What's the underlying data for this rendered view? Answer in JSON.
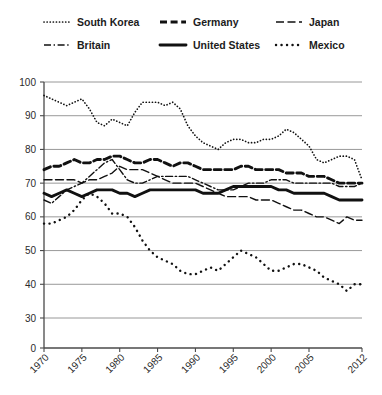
{
  "chart_data": {
    "type": "line",
    "title": "",
    "subtitle": "",
    "xlabel": "",
    "ylabel": "",
    "xlim": [
      1970,
      2012
    ],
    "ylim": [
      0,
      100
    ],
    "ytick_labels": [
      "0",
      "30",
      "40",
      "50",
      "60",
      "70",
      "80",
      "90",
      "100"
    ],
    "ytick_values": [
      0,
      30,
      40,
      50,
      60,
      70,
      80,
      90,
      100
    ],
    "y_axis_broken": true,
    "xtick_labels": [
      "1970",
      "1975",
      "1980",
      "1985",
      "1990",
      "1995",
      "2000",
      "2005",
      "2012"
    ],
    "xtick_values": [
      1970,
      1975,
      1980,
      1985,
      1990,
      1995,
      2000,
      2005,
      2012
    ],
    "grid": "horizontal",
    "legend_position": "top",
    "legend_columns": 3,
    "legend_rows": 2,
    "series": [
      {
        "name": "South Korea",
        "style": "dotted-fine",
        "marker": "dot",
        "x": [
          1970,
          1971,
          1972,
          1973,
          1974,
          1975,
          1976,
          1977,
          1978,
          1979,
          1980,
          1981,
          1982,
          1983,
          1984,
          1985,
          1986,
          1987,
          1988,
          1989,
          1990,
          1991,
          1992,
          1993,
          1994,
          1995,
          1996,
          1997,
          1998,
          1999,
          2000,
          2001,
          2002,
          2003,
          2004,
          2005,
          2006,
          2007,
          2008,
          2009,
          2010,
          2011,
          2012
        ],
        "values": [
          96,
          95,
          94,
          93,
          94,
          95,
          92,
          88,
          87,
          89,
          88,
          87,
          91,
          94,
          94,
          94,
          93,
          94,
          92,
          87,
          84,
          82,
          81,
          80,
          82,
          83,
          83,
          82,
          82,
          83,
          83,
          84,
          86,
          85,
          83,
          81,
          77,
          76,
          77,
          78,
          78,
          77,
          71
        ]
      },
      {
        "name": "Germany",
        "style": "dashed-bold",
        "x": [
          1970,
          1971,
          1972,
          1973,
          1974,
          1975,
          1976,
          1977,
          1978,
          1979,
          1980,
          1981,
          1982,
          1983,
          1984,
          1985,
          1986,
          1987,
          1988,
          1989,
          1990,
          1991,
          1992,
          1993,
          1994,
          1995,
          1996,
          1997,
          1998,
          1999,
          2000,
          2001,
          2002,
          2003,
          2004,
          2005,
          2006,
          2007,
          2008,
          2009,
          2010,
          2011,
          2012
        ],
        "values": [
          74,
          75,
          75,
          76,
          77,
          76,
          76,
          77,
          77,
          78,
          78,
          77,
          76,
          76,
          77,
          77,
          76,
          75,
          76,
          76,
          75,
          74,
          74,
          74,
          74,
          74,
          75,
          75,
          74,
          74,
          74,
          74,
          73,
          73,
          73,
          72,
          72,
          72,
          71,
          70,
          70,
          70,
          70
        ]
      },
      {
        "name": "Japan",
        "style": "dashed-thin",
        "x": [
          1970,
          1971,
          1972,
          1973,
          1974,
          1975,
          1976,
          1977,
          1978,
          1979,
          1980,
          1981,
          1982,
          1983,
          1984,
          1985,
          1986,
          1987,
          1988,
          1989,
          1990,
          1991,
          1992,
          1993,
          1994,
          1995,
          1996,
          1997,
          1998,
          1999,
          2000,
          2001,
          2002,
          2003,
          2004,
          2005,
          2006,
          2007,
          2008,
          2009,
          2010,
          2011,
          2012
        ],
        "values": [
          71,
          71,
          71,
          71,
          71,
          70,
          71,
          71,
          72,
          73,
          75,
          74,
          74,
          74,
          73,
          72,
          71,
          70,
          70,
          70,
          70,
          69,
          68,
          67,
          66,
          66,
          66,
          66,
          65,
          65,
          65,
          64,
          63,
          62,
          62,
          61,
          60,
          60,
          59,
          58,
          60,
          59,
          59
        ]
      },
      {
        "name": "Britain",
        "style": "dash-dot",
        "x": [
          1970,
          1971,
          1972,
          1973,
          1974,
          1975,
          1976,
          1977,
          1978,
          1979,
          1980,
          1981,
          1982,
          1983,
          1984,
          1985,
          1986,
          1987,
          1988,
          1989,
          1990,
          1991,
          1992,
          1993,
          1994,
          1995,
          1996,
          1997,
          1998,
          1999,
          2000,
          2001,
          2002,
          2003,
          2004,
          2005,
          2006,
          2007,
          2008,
          2009,
          2010,
          2011,
          2012
        ],
        "values": [
          65,
          64,
          66,
          68,
          69,
          70,
          72,
          74,
          76,
          77,
          74,
          71,
          70,
          70,
          71,
          72,
          72,
          72,
          72,
          72,
          71,
          70,
          69,
          68,
          68,
          68,
          69,
          70,
          70,
          70,
          71,
          71,
          71,
          70,
          70,
          70,
          70,
          70,
          70,
          69,
          69,
          69,
          70
        ]
      },
      {
        "name": "United States",
        "style": "solid-bold",
        "x": [
          1970,
          1971,
          1972,
          1973,
          1974,
          1975,
          1976,
          1977,
          1978,
          1979,
          1980,
          1981,
          1982,
          1983,
          1984,
          1985,
          1986,
          1987,
          1988,
          1989,
          1990,
          1991,
          1992,
          1993,
          1994,
          1995,
          1996,
          1997,
          1998,
          1999,
          2000,
          2001,
          2002,
          2003,
          2004,
          2005,
          2006,
          2007,
          2008,
          2009,
          2010,
          2011,
          2012
        ],
        "values": [
          67,
          66,
          67,
          68,
          67,
          66,
          67,
          68,
          68,
          68,
          67,
          67,
          66,
          67,
          68,
          68,
          68,
          68,
          68,
          68,
          68,
          67,
          67,
          67,
          68,
          69,
          69,
          69,
          69,
          69,
          69,
          68,
          68,
          67,
          67,
          67,
          67,
          67,
          66,
          65,
          65,
          65,
          65
        ]
      },
      {
        "name": "Mexico",
        "style": "dotted-sparse",
        "marker": "dot-large",
        "x": [
          1970,
          1971,
          1972,
          1973,
          1974,
          1975,
          1976,
          1977,
          1978,
          1979,
          1980,
          1981,
          1982,
          1983,
          1984,
          1985,
          1986,
          1987,
          1988,
          1989,
          1990,
          1991,
          1992,
          1993,
          1994,
          1995,
          1996,
          1997,
          1998,
          1999,
          2000,
          2001,
          2002,
          2003,
          2004,
          2005,
          2006,
          2007,
          2008,
          2009,
          2010,
          2011,
          2012
        ],
        "values": [
          58,
          58,
          59,
          60,
          62,
          65,
          67,
          66,
          64,
          61,
          61,
          60,
          57,
          53,
          50,
          48,
          47,
          46,
          44,
          43,
          43,
          44,
          45,
          44,
          46,
          48,
          50,
          49,
          48,
          46,
          44,
          44,
          45,
          46,
          46,
          45,
          44,
          42,
          41,
          40,
          38,
          40,
          40
        ]
      }
    ]
  },
  "legend": {
    "items": [
      {
        "label": "South Korea",
        "style": "dotted-fine"
      },
      {
        "label": "Germany",
        "style": "dashed-bold"
      },
      {
        "label": "Japan",
        "style": "dashed-thin"
      },
      {
        "label": "Britain",
        "style": "dash-dot"
      },
      {
        "label": "United States",
        "style": "solid-bold"
      },
      {
        "label": "Mexico",
        "style": "dotted-sparse"
      }
    ]
  },
  "colors": {
    "ink": "#111111",
    "grid": "#8d8d8d",
    "axis": "#4a4a4a",
    "background": "#ffffff"
  }
}
